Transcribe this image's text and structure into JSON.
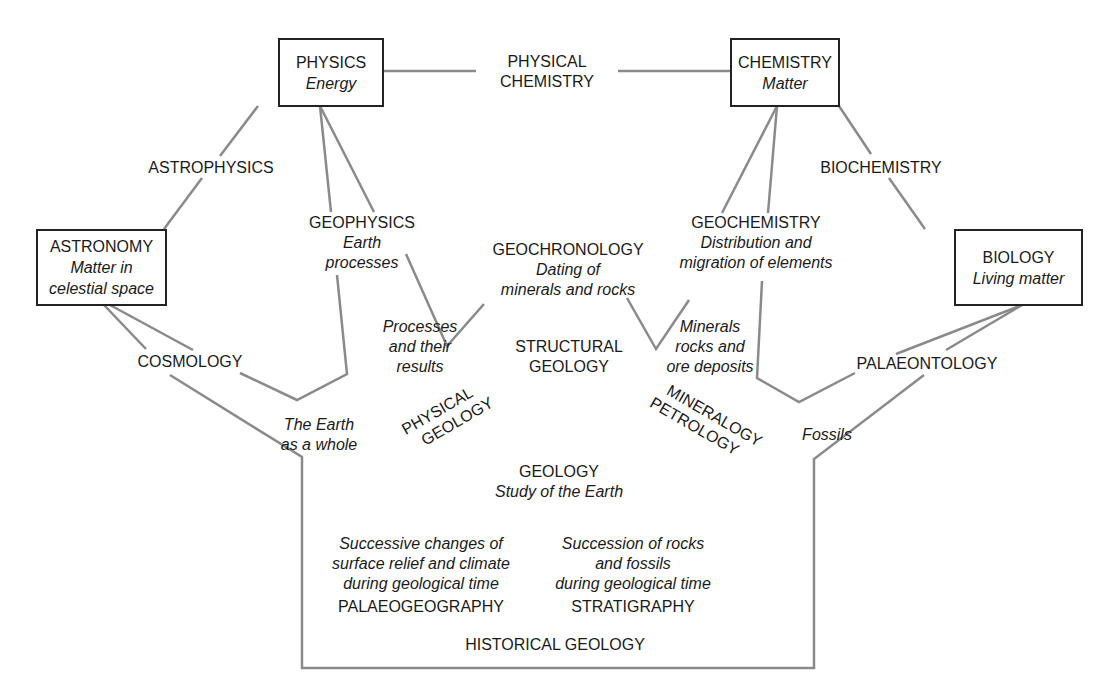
{
  "boxes": {
    "physics": {
      "title": "PHYSICS",
      "subtitle": "Energy"
    },
    "chemistry": {
      "title": "CHEMISTRY",
      "subtitle": "Matter"
    },
    "astronomy": {
      "title": "ASTRONOMY",
      "subtitle1": "Matter in",
      "subtitle2": "celestial space"
    },
    "biology": {
      "title": "BIOLOGY",
      "subtitle": "Living matter"
    }
  },
  "links": {
    "physical_chemistry": {
      "line1": "PHYSICAL",
      "line2": "CHEMISTRY"
    },
    "astrophysics": "ASTROPHYSICS",
    "biochemistry": "BIOCHEMISTRY",
    "cosmology": "COSMOLOGY",
    "palaeontology": "PALAEONTOLOGY"
  },
  "fields": {
    "geophysics": {
      "title": "GEOPHYSICS",
      "desc1": "Earth",
      "desc2": "processes"
    },
    "geochronology": {
      "title": "GEOCHRONOLOGY",
      "desc1": "Dating of",
      "desc2": "minerals and rocks"
    },
    "geochemistry": {
      "title": "GEOCHEMISTRY",
      "desc1": "Distribution and",
      "desc2": "migration of elements"
    },
    "structural_geology": {
      "line1": "STRUCTURAL",
      "line2": "GEOLOGY"
    },
    "processes": {
      "line1": "Processes",
      "line2": "and their",
      "line3": "results"
    },
    "minerals": {
      "line1": "Minerals",
      "line2": "rocks and",
      "line3": "ore deposits"
    },
    "earth_whole": {
      "line1": "The Earth",
      "line2": "as a whole"
    },
    "fossils": "Fossils",
    "physical_geology": {
      "line1": "PHYSICAL",
      "line2": "GEOLOGY"
    },
    "mineralogy_petrology": {
      "line1": "MINERALOGY",
      "line2": "PETROLOGY"
    },
    "geology": {
      "title": "GEOLOGY",
      "desc": "Study of the Earth"
    },
    "palaeogeography": {
      "desc1": "Successive changes of",
      "desc2": "surface relief and climate",
      "desc3": "during geological time",
      "title": "PALAEOGEOGRAPHY"
    },
    "stratigraphy": {
      "desc1": "Succession of rocks",
      "desc2": "and fossils",
      "desc3": "during geological time",
      "title": "STRATIGRAPHY"
    },
    "historical_geology": "HISTORICAL GEOLOGY"
  },
  "colors": {
    "line": "#8a8a8a",
    "box_border": "#222222",
    "text": "#1a1a1a"
  }
}
